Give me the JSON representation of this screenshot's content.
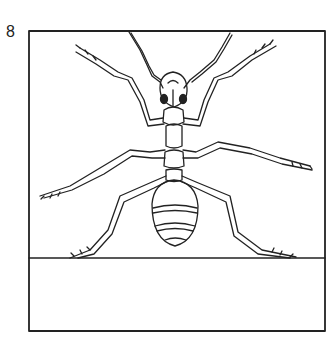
{
  "figure": {
    "number": "8",
    "caption_area": ""
  },
  "colors": {
    "ink": "#222222",
    "paper": "#ffffff"
  }
}
